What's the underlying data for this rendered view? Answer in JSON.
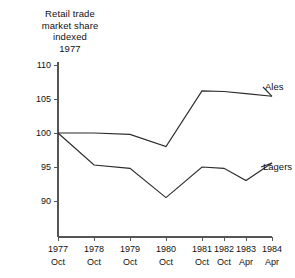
{
  "chart_data": {
    "type": "line",
    "title": "Retail trade\nmarket share\nindexed\n1977",
    "title_lines": [
      "Retail trade",
      "market share",
      "indexed",
      "1977"
    ],
    "xlabel": "",
    "ylabel": "",
    "grid": false,
    "legend_position": "right-inline",
    "ylim": [
      87,
      110
    ],
    "yticks": [
      110,
      105,
      100,
      95,
      90
    ],
    "ytick_labels": [
      "110",
      "105",
      "100",
      "95",
      "90"
    ],
    "categories": [
      "1977 Oct",
      "1978 Oct",
      "1979 Oct",
      "1980 Oct",
      "1981 Oct",
      "1982 Oct",
      "1983 Apr",
      "1984 Apr"
    ],
    "xtick_years": [
      "1977",
      "1978",
      "1979",
      "1980",
      "1981",
      "1982",
      "1983",
      "1984"
    ],
    "xtick_months": [
      "Oct",
      "Oct",
      "Oct",
      "Oct",
      "Oct",
      "Oct",
      "Apr",
      "Apr"
    ],
    "xtick_positions": [
      58,
      94,
      130,
      166,
      202,
      224,
      246,
      272
    ],
    "series": [
      {
        "name": "Ales",
        "values": [
          100.0,
          100.0,
          99.8,
          98.0,
          106.2,
          106.1,
          105.8,
          105.4
        ],
        "label": "Ales",
        "label_point": [
          265,
          90
        ],
        "color": "#2b2b2b"
      },
      {
        "name": "Lagers",
        "values": [
          100.0,
          95.3,
          94.8,
          90.5,
          95.0,
          94.8,
          93.0,
          95.6
        ],
        "label": "Lagers",
        "label_point": [
          263,
          170
        ],
        "color": "#2b2b2b"
      }
    ]
  },
  "colors": {
    "background": "#ffffff",
    "ink": "#1a1a1a",
    "axis": "#555555",
    "line": "#2b2b2b"
  }
}
